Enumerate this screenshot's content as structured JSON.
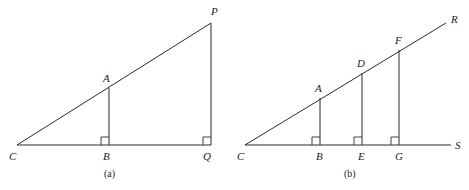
{
  "figure_a": {
    "caption": "(a)",
    "labels": {
      "C": "C",
      "B": "B",
      "Q": "Q",
      "A": "A",
      "P": "P"
    }
  },
  "figure_b": {
    "caption": "(b)",
    "labels": {
      "C": "C",
      "B": "B",
      "E": "E",
      "G": "G",
      "S": "S",
      "A": "A",
      "D": "D",
      "F": "F",
      "R": "R"
    }
  },
  "colors": {
    "line": "#2a2a2a",
    "background": "#ffffff"
  }
}
